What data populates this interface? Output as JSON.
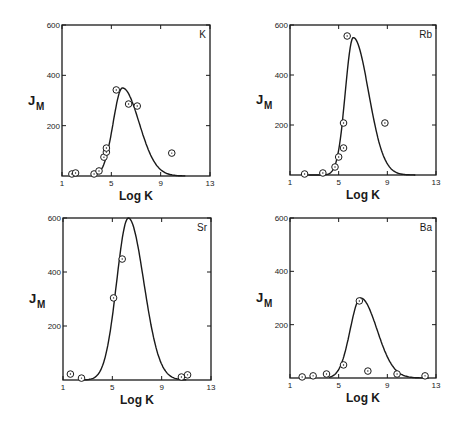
{
  "chart_data": [
    {
      "type": "scatter",
      "panel_label": "K",
      "title": "",
      "xlabel": "Log K",
      "ylabel": "J",
      "ylabel_subscript": "M",
      "xlim": [
        1,
        13
      ],
      "ylim": [
        0,
        600
      ],
      "xticks": [
        1,
        5,
        9,
        13
      ],
      "yticks": [
        200,
        400,
        600
      ],
      "grid": false,
      "frame_px": {
        "left": 62,
        "top": 25,
        "right": 210,
        "bottom": 176
      },
      "points": [
        {
          "x": 1.8,
          "y": 8
        },
        {
          "x": 2.1,
          "y": 12
        },
        {
          "x": 3.6,
          "y": 8
        },
        {
          "x": 4.0,
          "y": 20
        },
        {
          "x": 4.4,
          "y": 75
        },
        {
          "x": 4.6,
          "y": 95
        },
        {
          "x": 4.6,
          "y": 111
        },
        {
          "x": 5.4,
          "y": 342
        },
        {
          "x": 6.4,
          "y": 286
        },
        {
          "x": 7.1,
          "y": 278
        },
        {
          "x": 9.9,
          "y": 91
        }
      ],
      "curve": {
        "peak_x": 5.9,
        "peak_y": 350,
        "width_left": 0.75,
        "width_right": 1.35,
        "start_x": 3.5,
        "end_x": 11.0
      }
    },
    {
      "type": "scatter",
      "panel_label": "Rb",
      "title": "",
      "xlabel": "Log K",
      "ylabel": "J",
      "ylabel_subscript": "M",
      "xlim": [
        1,
        13
      ],
      "ylim": [
        0,
        600
      ],
      "xticks": [
        1,
        5,
        9,
        13
      ],
      "yticks": [
        200,
        400,
        600
      ],
      "grid": false,
      "frame_px": {
        "left": 290,
        "top": 25,
        "right": 436,
        "bottom": 175
      },
      "points": [
        {
          "x": 2.2,
          "y": 4
        },
        {
          "x": 3.7,
          "y": 8
        },
        {
          "x": 4.7,
          "y": 32
        },
        {
          "x": 5.0,
          "y": 72
        },
        {
          "x": 5.4,
          "y": 108
        },
        {
          "x": 5.4,
          "y": 208
        },
        {
          "x": 5.7,
          "y": 556
        },
        {
          "x": 8.8,
          "y": 208
        }
      ],
      "curve": {
        "peak_x": 6.2,
        "peak_y": 550,
        "width_left": 0.65,
        "width_right": 1.25,
        "start_x": 2.5,
        "end_x": 11.3
      }
    },
    {
      "type": "scatter",
      "panel_label": "Sr",
      "title": "",
      "xlabel": "Log K",
      "ylabel": "J",
      "ylabel_subscript": "M",
      "xlim": [
        1,
        13
      ],
      "ylim": [
        0,
        600
      ],
      "xticks": [
        1,
        5,
        9,
        13
      ],
      "yticks": [
        200,
        400,
        600
      ],
      "grid": false,
      "frame_px": {
        "left": 63,
        "top": 218,
        "right": 211,
        "bottom": 380
      },
      "points": [
        {
          "x": 1.6,
          "y": 22
        },
        {
          "x": 2.5,
          "y": 7
        },
        {
          "x": 5.1,
          "y": 304
        },
        {
          "x": 5.8,
          "y": 448
        },
        {
          "x": 10.6,
          "y": 11
        },
        {
          "x": 11.1,
          "y": 19
        }
      ],
      "curve": {
        "peak_x": 6.3,
        "peak_y": 600,
        "width_left": 0.95,
        "width_right": 1.25,
        "start_x": 2.6,
        "end_x": 11.0
      }
    },
    {
      "type": "scatter",
      "panel_label": "Ba",
      "title": "",
      "xlabel": "Log K",
      "ylabel": "J",
      "ylabel_subscript": "M",
      "xlim": [
        1,
        13
      ],
      "ylim": [
        0,
        600
      ],
      "xticks": [
        1,
        5,
        9,
        13
      ],
      "yticks": [
        200,
        400,
        600
      ],
      "grid": false,
      "frame_px": {
        "left": 290,
        "top": 218,
        "right": 436,
        "bottom": 378
      },
      "points": [
        {
          "x": 2.0,
          "y": 4
        },
        {
          "x": 2.9,
          "y": 8
        },
        {
          "x": 4.0,
          "y": 15
        },
        {
          "x": 5.4,
          "y": 49
        },
        {
          "x": 6.7,
          "y": 289
        },
        {
          "x": 7.4,
          "y": 26
        },
        {
          "x": 9.8,
          "y": 15
        },
        {
          "x": 12.1,
          "y": 8
        }
      ],
      "curve": {
        "peak_x": 6.8,
        "peak_y": 300,
        "width_left": 0.85,
        "width_right": 1.35,
        "start_x": 4.2,
        "end_x": 12.4
      }
    }
  ]
}
